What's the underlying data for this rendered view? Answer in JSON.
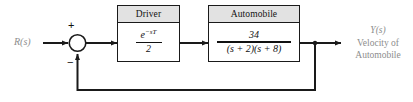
{
  "diagram": {
    "input_label": "R(s)",
    "summing_junction": {
      "name": "summing-junction",
      "plus_sign": "+",
      "minus_sign": "−"
    },
    "blocks": [
      {
        "id": "driver",
        "header": "Driver",
        "numerator": "e",
        "numerator_exponent": "−sT",
        "denominator": "2"
      },
      {
        "id": "automobile",
        "header": "Automobile",
        "numerator": "34",
        "denominator": "(s + 2)(s + 8)"
      }
    ],
    "output": {
      "symbol": "Y(s)",
      "line1": "Velocity of",
      "line2": "Automobile"
    },
    "colors": {
      "line": "#1a1a1a",
      "header_fill": "#e2e2e2",
      "label_text": "#8d8d8d",
      "block_text": "#111111",
      "background": "#ffffff"
    }
  }
}
